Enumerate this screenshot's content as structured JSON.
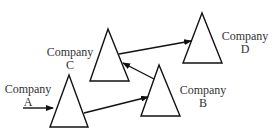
{
  "diagram": {
    "type": "company-network-flow",
    "nodes": [
      {
        "id": "A",
        "name": "Company",
        "letter": "A"
      },
      {
        "id": "B",
        "name": "Company",
        "letter": "B"
      },
      {
        "id": "C",
        "name": "Company",
        "letter": "C"
      },
      {
        "id": "D",
        "name": "Company",
        "letter": "D"
      }
    ],
    "edges": [
      {
        "from": "external",
        "to": "A"
      },
      {
        "from": "A",
        "to": "B"
      },
      {
        "from": "B",
        "to": "C"
      },
      {
        "from": "C",
        "to": "D"
      }
    ],
    "colors": {
      "stroke": "#111111",
      "text": "#333333"
    }
  }
}
